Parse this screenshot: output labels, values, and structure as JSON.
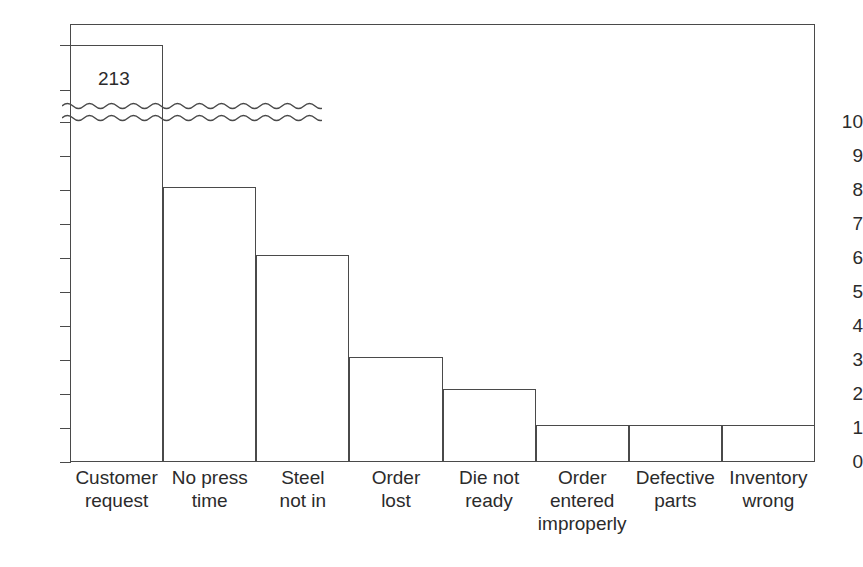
{
  "chart_data": {
    "type": "bar",
    "title": "",
    "subtitle": "",
    "xlabel": "",
    "ylabel": "",
    "categories": [
      "Customer request",
      "No press time",
      "Steel not in",
      "Order lost",
      "Die not ready",
      "Order entered improperly",
      "Defective parts",
      "Inventory wrong"
    ],
    "category_lines": [
      [
        "Customer",
        "request"
      ],
      [
        "No press",
        "time"
      ],
      [
        "Steel",
        "not in"
      ],
      [
        "Order",
        "lost"
      ],
      [
        "Die not",
        "ready"
      ],
      [
        "Order",
        "entered",
        "improperly"
      ],
      [
        "Defective",
        "parts"
      ],
      [
        "Inventory",
        "wrong"
      ]
    ],
    "values": [
      213,
      8.1,
      6.1,
      3.1,
      2.15,
      1.1,
      1.1,
      1.1
    ],
    "data_labels": [
      "213",
      "",
      "",
      "",
      "",
      "",
      "",
      ""
    ],
    "ylim": [
      0,
      10
    ],
    "yticks": [
      0,
      1,
      2,
      3,
      4,
      5,
      6,
      7,
      8,
      9,
      10
    ],
    "ytick_labels": [
      "0",
      "1",
      "2",
      "3",
      "4",
      "5",
      "6",
      "7",
      "8",
      "9",
      "10"
    ],
    "axis_break": {
      "present": true,
      "style": "wavy-double-line",
      "above_value": 10,
      "note": "first bar truncated; actual value 213"
    },
    "grid": false,
    "legend": null,
    "bar_fill": "#ffffff",
    "bar_stroke": "#4a4a4a",
    "frame": true
  },
  "colors": {
    "background": "#ffffff",
    "line": "#4a4a4a",
    "text": "#2b2b2b"
  }
}
